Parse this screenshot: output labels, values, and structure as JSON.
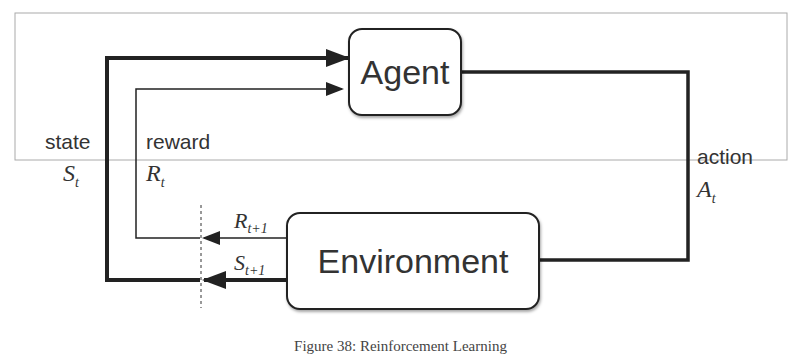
{
  "diagram": {
    "agent_label": "Agent",
    "environment_label": "Environment",
    "state_label": "state",
    "state_symbol": "S",
    "state_sub": "t",
    "reward_label": "reward",
    "reward_symbol": "R",
    "reward_sub": "t",
    "action_label": "action",
    "action_symbol": "A",
    "action_sub": "t",
    "next_reward_symbol": "R",
    "next_reward_sub": "t+1",
    "next_state_symbol": "S",
    "next_state_sub": "t+1"
  },
  "caption": "Figure 38: Reinforcement Learning",
  "colors": {
    "line": "#222222",
    "text": "#333333",
    "border": "#aaaaaa"
  }
}
